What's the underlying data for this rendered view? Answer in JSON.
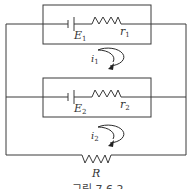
{
  "diagram": {
    "type": "circuit",
    "branches": [
      {
        "battery": {
          "label": "E",
          "subscript": "1"
        },
        "resistor": {
          "label": "r",
          "subscript": "1"
        }
      },
      {
        "battery": {
          "label": "E",
          "subscript": "2"
        },
        "resistor": {
          "label": "r",
          "subscript": "2"
        }
      }
    ],
    "load_resistor": {
      "label": "R"
    },
    "loops": [
      {
        "label": "i",
        "subscript": "1",
        "direction": "clockwise"
      },
      {
        "label": "i",
        "subscript": "2",
        "direction": "clockwise"
      }
    ],
    "caption": "그림 7.6.2"
  }
}
